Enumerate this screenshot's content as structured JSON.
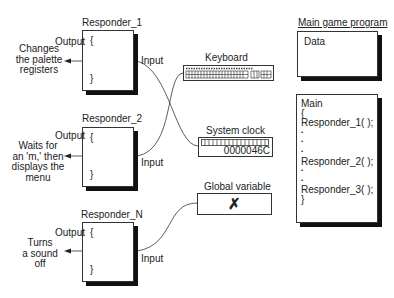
{
  "responders": [
    {
      "title": "Responder_1",
      "output_label": "Output",
      "input_label": "Input",
      "open_brace": "{",
      "close_brace": "}",
      "description": "Changes\nthe palette\nregisters"
    },
    {
      "title": "Responder_2",
      "output_label": "Output",
      "input_label": "Input",
      "open_brace": "{",
      "close_brace": "}",
      "description": "Waits for\nan 'm,' then\ndisplays the\nmenu"
    },
    {
      "title": "Responder_N",
      "output_label": "Output",
      "input_label": "Input",
      "open_brace": "{",
      "close_brace": "}",
      "description": "Turns\na sound\noff"
    }
  ],
  "sources": {
    "keyboard": {
      "label": "Keyboard",
      "icon": "keyboard-icon"
    },
    "system_clock": {
      "label": "System clock",
      "value": "0000046C"
    },
    "global_variable": {
      "label": "Global variable",
      "value": "✗"
    }
  },
  "main_program": {
    "title": "Main game program",
    "data_label": "Data",
    "code_lines": [
      "Main",
      "{",
      "Responder_1( );",
      "•",
      "•",
      "•",
      "Responder_2( );",
      "•",
      "•",
      "Responder_3( );",
      "}"
    ]
  }
}
